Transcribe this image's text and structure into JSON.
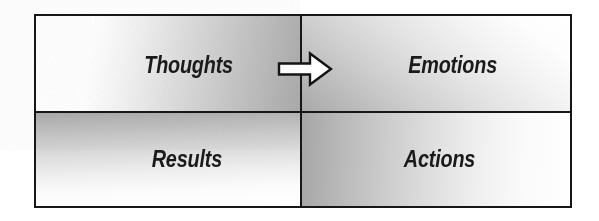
{
  "diagram": {
    "frame_border_color": "#17171a",
    "text_color": "#1a1a1c",
    "background_color": "#ffffff",
    "quadrants": [
      {
        "id": "thoughts",
        "label": "Thoughts",
        "position": "top-left",
        "shading": "white-left-to-gray-right",
        "gradient_from": "#ffffff",
        "gradient_to": "#ababab"
      },
      {
        "id": "emotions",
        "label": "Emotions",
        "position": "top-right",
        "shading": "gray-bottom-left-to-white-top-right",
        "gradient_from": "#a9a9a9",
        "gradient_to": "#ffffff"
      },
      {
        "id": "results",
        "label": "Results",
        "position": "bottom-left",
        "shading": "gray-top-to-white-bottom",
        "gradient_from": "#a8a8a8",
        "gradient_to": "#ffffff"
      },
      {
        "id": "actions",
        "label": "Actions",
        "position": "bottom-right",
        "shading": "gray-left-to-white-right",
        "gradient_from": "#a6a6a6",
        "gradient_to": "#ffffff"
      }
    ],
    "connector": {
      "icon": "right-block-arrow-icon",
      "direction": "right",
      "from": "Thoughts",
      "to": "Emotions",
      "fill": "#ffffff",
      "stroke": "#141416"
    }
  }
}
